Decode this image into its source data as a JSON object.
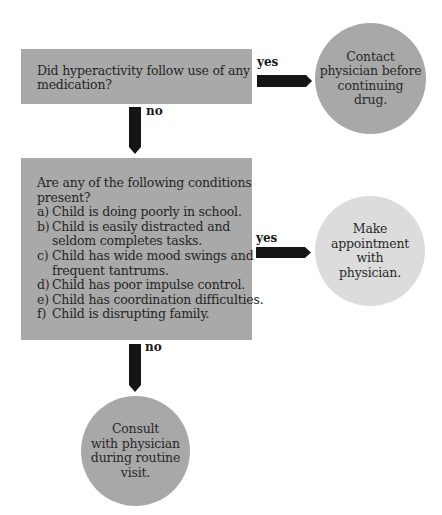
{
  "flowchart": {
    "question1": {
      "lines": [
        "Did hyperactivity follow use of any",
        "medication?"
      ]
    },
    "yes1_label": "yes",
    "no1_label": "no",
    "outcome1": {
      "lines": [
        "Contact",
        "physician before",
        "continuing",
        "drug."
      ]
    },
    "question2": {
      "intro_lines": [
        "Are any of the following conditions",
        "present?"
      ],
      "items": [
        {
          "marker": "a)",
          "lines": [
            "Child is doing poorly in school."
          ]
        },
        {
          "marker": "b)",
          "lines": [
            "Child is easily distracted and",
            "seldom completes tasks."
          ]
        },
        {
          "marker": "c)",
          "lines": [
            "Child has wide mood swings and",
            "frequent tantrums."
          ]
        },
        {
          "marker": "d)",
          "lines": [
            "Child has poor impulse control."
          ]
        },
        {
          "marker": "e)",
          "lines": [
            "Child has coordination difficulties."
          ]
        },
        {
          "marker": "f)",
          "lines": [
            "Child is disrupting family."
          ]
        }
      ]
    },
    "yes2_label": "yes",
    "no2_label": "no",
    "outcome2": {
      "lines": [
        "Make",
        "appointment",
        "with",
        "physician."
      ]
    },
    "outcome3": {
      "lines": [
        "Consult",
        "with physician",
        "during routine",
        "visit."
      ]
    },
    "colors": {
      "box": "#a9a9a9",
      "circle_dark": "#a8a8a8",
      "circle_light": "#dcdcdc",
      "arrow": "#151515"
    }
  }
}
